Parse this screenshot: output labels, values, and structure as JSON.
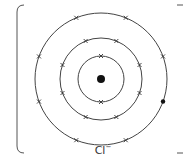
{
  "diagram": {
    "type": "dot-and-cross electron shell diagram",
    "ion_label": "Cl",
    "ion_charge": "−",
    "nucleus": {
      "cx": 101,
      "cy": 79,
      "r": 4
    },
    "shells": [
      {
        "r": 23,
        "crosses": 2,
        "dots": 0
      },
      {
        "r": 41,
        "crosses": 8,
        "dots": 0
      },
      {
        "r": 66,
        "crosses": 7,
        "dots": 1
      }
    ],
    "colors": {
      "line": "#444444",
      "fill": "#111111",
      "background": "#ffffff"
    }
  }
}
